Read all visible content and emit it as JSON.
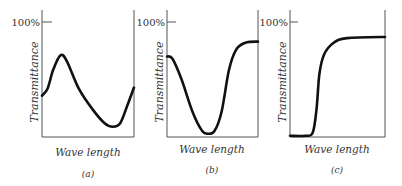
{
  "figure": {
    "panels": [
      {
        "id": "a",
        "caption": "(a)",
        "ylabel": "Transmittance",
        "xlabel": "Wave length",
        "ytick": "100%",
        "curve_description": "peak then deep valley, rising at end",
        "points": [
          [
            0,
            0.36
          ],
          [
            0.06,
            0.42
          ],
          [
            0.12,
            0.58
          ],
          [
            0.2,
            0.71
          ],
          [
            0.27,
            0.66
          ],
          [
            0.4,
            0.42
          ],
          [
            0.55,
            0.24
          ],
          [
            0.68,
            0.12
          ],
          [
            0.77,
            0.09
          ],
          [
            0.85,
            0.12
          ],
          [
            0.93,
            0.28
          ],
          [
            1,
            0.43
          ]
        ]
      },
      {
        "id": "b",
        "caption": "(b)",
        "ylabel": "Transmittance",
        "xlabel": "Wave length",
        "ytick": "100%",
        "curve_description": "single broad absorption valley",
        "points": [
          [
            0,
            0.7
          ],
          [
            0.06,
            0.68
          ],
          [
            0.16,
            0.5
          ],
          [
            0.28,
            0.22
          ],
          [
            0.38,
            0.06
          ],
          [
            0.44,
            0.03
          ],
          [
            0.52,
            0.05
          ],
          [
            0.6,
            0.22
          ],
          [
            0.68,
            0.58
          ],
          [
            0.76,
            0.76
          ],
          [
            0.86,
            0.82
          ],
          [
            1,
            0.83
          ]
        ]
      },
      {
        "id": "c",
        "caption": "(c)",
        "ylabel": "Transmittance",
        "xlabel": "Wave length",
        "ytick": "100%",
        "curve_description": "cutoff filter: step from near zero to high transmittance",
        "points": [
          [
            0,
            0.01
          ],
          [
            0.16,
            0.01
          ],
          [
            0.24,
            0.04
          ],
          [
            0.28,
            0.25
          ],
          [
            0.31,
            0.55
          ],
          [
            0.36,
            0.72
          ],
          [
            0.46,
            0.82
          ],
          [
            0.6,
            0.86
          ],
          [
            1,
            0.87
          ]
        ]
      }
    ]
  }
}
